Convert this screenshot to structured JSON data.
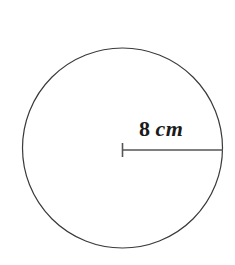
{
  "figure": {
    "background_color": "#ffffff",
    "stroke_color": "#3a3a3a",
    "line_color": "#555555",
    "text_color": "#1b1b1b"
  },
  "shape": {
    "type": "circle",
    "center_x": 122.5,
    "center_y": 148,
    "radius_px": 100,
    "stroke_width": 1.2
  },
  "radius_line": {
    "from_x": 122.5,
    "from_y": 150,
    "to_x": 223,
    "to_y": 150,
    "stroke_width": 1.6,
    "tick_x": 122.5,
    "tick_top_y": 143,
    "tick_bottom_y": 157,
    "tick_stroke_width": 1.6
  },
  "label": {
    "full_text": "8 cm",
    "value": "8",
    "unit": "cm",
    "x": 139,
    "y": 118
  },
  "measurement": {
    "quantity": "radius",
    "value": 8,
    "unit": "cm"
  }
}
